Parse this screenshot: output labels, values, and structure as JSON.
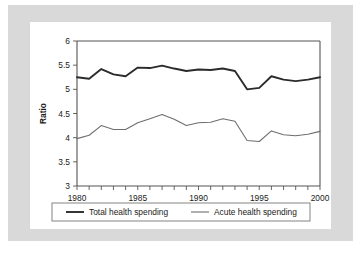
{
  "chart_data": {
    "type": "line",
    "title": "",
    "xlabel": "",
    "ylabel": "Ratio",
    "xlim": [
      1980,
      2000
    ],
    "ylim": [
      3,
      6
    ],
    "grid": false,
    "legend_position": "bottom",
    "y_ticks": [
      "3",
      "3.5",
      "4",
      "4.5",
      "5",
      "5.5",
      "6"
    ],
    "y_tick_values": [
      3,
      3.5,
      4,
      4.5,
      5,
      5.5,
      6
    ],
    "x_ticks": [
      "1980",
      "1985",
      "1990",
      "1995",
      "2000"
    ],
    "x_tick_values": [
      1980,
      1985,
      1990,
      1995,
      2000
    ],
    "x_minor_step": 1,
    "x": [
      1980,
      1981,
      1982,
      1983,
      1984,
      1985,
      1986,
      1987,
      1988,
      1989,
      1990,
      1991,
      1992,
      1993,
      1994,
      1995,
      1996,
      1997,
      1998,
      1999,
      2000
    ],
    "series": [
      {
        "name": "Total health spending",
        "color": "#2b2b2b",
        "width": 1.9,
        "values": [
          5.25,
          5.22,
          5.42,
          5.31,
          5.27,
          5.45,
          5.44,
          5.49,
          5.43,
          5.38,
          5.41,
          5.4,
          5.43,
          5.38,
          5.0,
          5.03,
          5.27,
          5.2,
          5.17,
          5.2,
          5.25
        ]
      },
      {
        "name": "Acute health spending",
        "color": "#6e6e6e",
        "width": 1.1,
        "values": [
          3.98,
          4.05,
          4.25,
          4.17,
          4.17,
          4.31,
          4.39,
          4.48,
          4.38,
          4.25,
          4.31,
          4.32,
          4.39,
          4.34,
          3.94,
          3.92,
          4.14,
          4.06,
          4.04,
          4.07,
          4.13
        ]
      }
    ]
  },
  "legend": {
    "entries": [
      {
        "label": "Total health spending"
      },
      {
        "label": "Acute health spending"
      }
    ]
  }
}
